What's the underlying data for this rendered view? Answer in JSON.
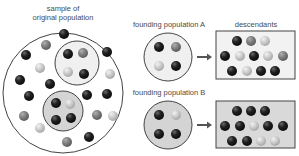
{
  "labels": {
    "sample_line1": "sample of",
    "sample_line2": "original population",
    "founding_a": "founding population A",
    "founding_b": "founding population B",
    "descendants": "descendants"
  },
  "colors": {
    "dark": "#1e1e1e",
    "medium": "#7f7f7f",
    "light": "#c8c8c8",
    "circle_stroke": "#444444",
    "circle_a_fill": "#f0f0f0",
    "circle_b_fill": "#d4d4d4",
    "box_a_fill": "#f2f2f2",
    "box_b_fill": "#d9d9d9",
    "arrow": "#555555"
  },
  "diagram": {
    "original_population": {
      "circle": {
        "cx": 63,
        "cy": 93,
        "r": 60
      },
      "balls": [
        {
          "x": 64,
          "y": 34,
          "c": "dark"
        },
        {
          "x": 46,
          "y": 45,
          "c": "medium"
        },
        {
          "x": 26,
          "y": 55,
          "c": "dark"
        },
        {
          "x": 107,
          "y": 52,
          "c": "dark"
        },
        {
          "x": 40,
          "y": 68,
          "c": "light"
        },
        {
          "x": 110,
          "y": 74,
          "c": "light"
        },
        {
          "x": 20,
          "y": 80,
          "c": "dark"
        },
        {
          "x": 50,
          "y": 84,
          "c": "dark"
        },
        {
          "x": 29,
          "y": 96,
          "c": "dark"
        },
        {
          "x": 87,
          "y": 95,
          "c": "dark"
        },
        {
          "x": 107,
          "y": 94,
          "c": "dark"
        },
        {
          "x": 24,
          "y": 116,
          "c": "medium"
        },
        {
          "x": 97,
          "y": 115,
          "c": "medium"
        },
        {
          "x": 113,
          "y": 116,
          "c": "light"
        },
        {
          "x": 40,
          "y": 128,
          "c": "light"
        },
        {
          "x": 89,
          "y": 137,
          "c": "dark"
        },
        {
          "x": 67,
          "y": 142,
          "c": "medium"
        }
      ]
    },
    "subgroup_a": {
      "circle": {
        "cx": 77,
        "cy": 63,
        "r": 22
      },
      "balls": [
        {
          "x": 68,
          "y": 54,
          "c": "dark"
        },
        {
          "x": 83,
          "y": 53,
          "c": "medium"
        },
        {
          "x": 68,
          "y": 72,
          "c": "light"
        },
        {
          "x": 84,
          "y": 74,
          "c": "dark"
        }
      ]
    },
    "subgroup_b": {
      "circle": {
        "cx": 63,
        "cy": 111,
        "r": 20
      },
      "balls": [
        {
          "x": 56,
          "y": 103,
          "c": "dark"
        },
        {
          "x": 70,
          "y": 104,
          "c": "light"
        },
        {
          "x": 56,
          "y": 120,
          "c": "dark"
        },
        {
          "x": 71,
          "y": 118,
          "c": "dark"
        }
      ]
    },
    "founding_a": {
      "circle": {
        "cx": 168,
        "cy": 57,
        "r": 24
      },
      "balls": [
        {
          "x": 159,
          "y": 47,
          "c": "dark"
        },
        {
          "x": 176,
          "y": 47,
          "c": "medium"
        },
        {
          "x": 159,
          "y": 66,
          "c": "light"
        },
        {
          "x": 176,
          "y": 66,
          "c": "dark"
        }
      ]
    },
    "founding_b": {
      "circle": {
        "cx": 168,
        "cy": 125,
        "r": 24
      },
      "balls": [
        {
          "x": 159,
          "y": 115,
          "c": "dark"
        },
        {
          "x": 176,
          "y": 115,
          "c": "light"
        },
        {
          "x": 159,
          "y": 134,
          "c": "dark"
        },
        {
          "x": 176,
          "y": 134,
          "c": "dark"
        }
      ]
    },
    "arrow_a": {
      "x1": 197,
      "y1": 57,
      "x2": 212,
      "y2": 57
    },
    "arrow_b": {
      "x1": 197,
      "y1": 125,
      "x2": 212,
      "y2": 125
    },
    "descendants_a": {
      "box": {
        "x": 216,
        "y": 31,
        "w": 79,
        "h": 48
      },
      "balls": [
        {
          "x": 237,
          "y": 41,
          "c": "dark"
        },
        {
          "x": 251,
          "y": 41,
          "c": "medium"
        },
        {
          "x": 265,
          "y": 41,
          "c": "light"
        },
        {
          "x": 225,
          "y": 56,
          "c": "dark"
        },
        {
          "x": 240,
          "y": 56,
          "c": "light"
        },
        {
          "x": 254,
          "y": 56,
          "c": "dark"
        },
        {
          "x": 268,
          "y": 56,
          "c": "light"
        },
        {
          "x": 283,
          "y": 56,
          "c": "medium"
        },
        {
          "x": 232,
          "y": 71,
          "c": "dark"
        },
        {
          "x": 247,
          "y": 71,
          "c": "light"
        },
        {
          "x": 261,
          "y": 71,
          "c": "dark"
        },
        {
          "x": 275,
          "y": 71,
          "c": "dark"
        }
      ]
    },
    "descendants_b": {
      "box": {
        "x": 216,
        "y": 101,
        "w": 79,
        "h": 47
      },
      "balls": [
        {
          "x": 237,
          "y": 111,
          "c": "dark"
        },
        {
          "x": 251,
          "y": 111,
          "c": "dark"
        },
        {
          "x": 265,
          "y": 111,
          "c": "dark"
        },
        {
          "x": 225,
          "y": 126,
          "c": "dark"
        },
        {
          "x": 240,
          "y": 126,
          "c": "dark"
        },
        {
          "x": 254,
          "y": 126,
          "c": "light"
        },
        {
          "x": 268,
          "y": 126,
          "c": "dark"
        },
        {
          "x": 283,
          "y": 126,
          "c": "dark"
        },
        {
          "x": 232,
          "y": 141,
          "c": "dark"
        },
        {
          "x": 247,
          "y": 141,
          "c": "dark"
        },
        {
          "x": 261,
          "y": 141,
          "c": "light"
        },
        {
          "x": 275,
          "y": 141,
          "c": "light"
        }
      ]
    }
  }
}
